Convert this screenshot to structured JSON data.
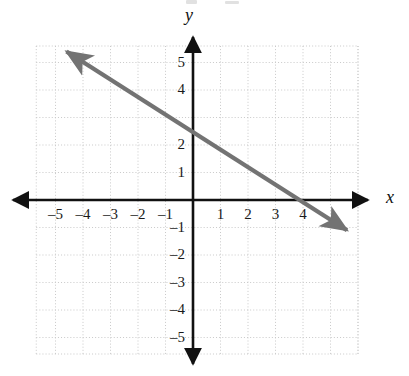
{
  "figure": {
    "kind": "coordinate-plane-line-graph",
    "width": 409,
    "height": 376,
    "background_color": "#ffffff"
  },
  "axes": {
    "x_axis_label": "x",
    "y_axis_label": "y",
    "axis_color": "#111111",
    "grid_color": "#cccccc",
    "grid_style": "dotted",
    "origin_px": {
      "x": 193,
      "y": 200
    },
    "unit_px": 27.5,
    "x_range": [
      -5.7,
      6.0
    ],
    "y_range": [
      -5.6,
      5.6
    ],
    "x_tick_labels": [
      "-5",
      "-4",
      "-3",
      "-2",
      "-1",
      "1",
      "2",
      "3",
      "4"
    ],
    "y_tick_labels": [
      "5",
      "4",
      "3",
      "2",
      "1",
      "-1",
      "-2",
      "-3",
      "-4",
      "-5"
    ],
    "y_tick_hidden": [
      "3"
    ]
  },
  "chart_data": {
    "type": "line",
    "title": "",
    "xlabel": "x",
    "ylabel": "y",
    "xlim": [
      -5.7,
      6.0
    ],
    "ylim": [
      -5.6,
      5.6
    ],
    "grid": true,
    "legend": "none",
    "x_ticks": [
      -5,
      -4,
      -3,
      -2,
      -1,
      1,
      2,
      3,
      4
    ],
    "y_ticks": [
      5,
      4,
      3,
      2,
      1,
      -1,
      -2,
      -3,
      -4,
      -5
    ],
    "series": [
      {
        "name": "line",
        "color": "#737373",
        "slope": -0.625,
        "y_intercept": 2.5,
        "x_intercept": 4.0,
        "equation": "y = -5/8 x + 5/2",
        "arrow_start": {
          "x": -4.6,
          "y": 5.4
        },
        "arrow_end": {
          "x": 5.6,
          "y": -1.1
        },
        "arrowheads": "both",
        "points": [
          {
            "x": -4.6,
            "y": 5.4
          },
          {
            "x": 0,
            "y": 2.5
          },
          {
            "x": 4,
            "y": 0
          },
          {
            "x": 5.6,
            "y": -1.1
          }
        ]
      }
    ]
  },
  "labels": {
    "x_ticks": [
      {
        "text": "-5",
        "x": -5
      },
      {
        "text": "-4",
        "x": -4
      },
      {
        "text": "-3",
        "x": -3
      },
      {
        "text": "-2",
        "x": -2
      },
      {
        "text": "-1",
        "x": -1
      },
      {
        "text": "1",
        "x": 1
      },
      {
        "text": "2",
        "x": 2
      },
      {
        "text": "3",
        "x": 3
      },
      {
        "text": "4",
        "x": 4
      }
    ],
    "y_ticks": [
      {
        "text": "5",
        "y": 5,
        "hidden": false
      },
      {
        "text": "4",
        "y": 4,
        "hidden": false
      },
      {
        "text": "3",
        "y": 3,
        "hidden": true
      },
      {
        "text": "2",
        "y": 2,
        "hidden": false
      },
      {
        "text": "1",
        "y": 1,
        "hidden": false
      },
      {
        "text": "-1",
        "y": -1,
        "hidden": false
      },
      {
        "text": "-2",
        "y": -2,
        "hidden": false
      },
      {
        "text": "-3",
        "y": -3,
        "hidden": false
      },
      {
        "text": "-4",
        "y": -4,
        "hidden": false
      },
      {
        "text": "-5",
        "y": -5,
        "hidden": false
      }
    ]
  }
}
